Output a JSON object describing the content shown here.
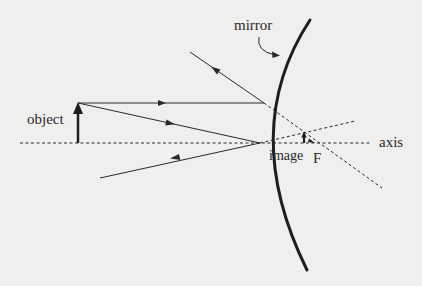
{
  "diagram": {
    "type": "convex-mirror-ray-diagram",
    "labels": {
      "mirror": "mirror",
      "object": "object",
      "image": "image",
      "focal_point": "F",
      "axis": "axis"
    },
    "colors": {
      "background": "#efefee",
      "ink": "#2a2a2a"
    }
  }
}
